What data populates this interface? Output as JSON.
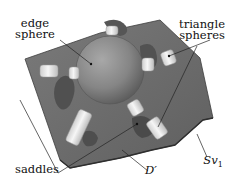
{
  "figure": {
    "labels": {
      "edge_sphere_line1": "edge",
      "edge_sphere_line2": "sphere",
      "triangle_spheres_line1": "triangle",
      "triangle_spheres_line2": "spheres",
      "saddles": "saddles",
      "d_prime": "D′",
      "sv1_main": "Sv",
      "sv1_sub": "1"
    },
    "colors": {
      "plate": "#6f6f6f",
      "plate_edge": "#4a4a4a",
      "sphere": "#8a8a8a",
      "cylinder": "#e8e8e8",
      "background": "#ffffff"
    }
  }
}
